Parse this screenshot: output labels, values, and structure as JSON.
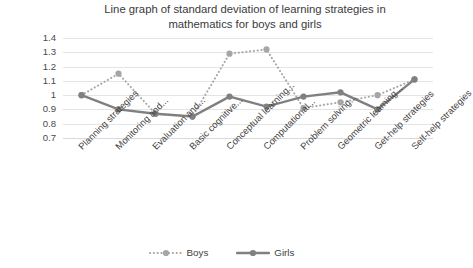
{
  "chart_data": {
    "type": "line",
    "title": "Line graph of standard deviation of learning strategies in mathematics for boys and girls",
    "xlabel": "",
    "ylabel": "",
    "ylim": [
      0.7,
      1.4
    ],
    "ytick_labels": [
      "1.4",
      "1.3",
      "1.2",
      "1.1",
      "1",
      "0.9",
      "0.8",
      "0.7"
    ],
    "ytick_values": [
      1.4,
      1.3,
      1.2,
      1.1,
      1.0,
      0.9,
      0.8,
      0.7
    ],
    "grid": true,
    "legend_position": "bottom",
    "categories": [
      "Planning strategies",
      "Monitoring and...",
      "Evaluation and...",
      "Basic cognitive...",
      "Conceptual learning...",
      "Computational...",
      "Problem solving...",
      "Geometric learning...",
      "Get-help strategies",
      "Self-help strategies"
    ],
    "series": [
      {
        "name": "Boys",
        "color": "#a6a6a6",
        "style": "dotted",
        "values": [
          1.0,
          1.15,
          0.87,
          0.85,
          1.29,
          1.32,
          0.91,
          0.95,
          1.0,
          1.11
        ]
      },
      {
        "name": "Girls",
        "color": "#808080",
        "style": "solid",
        "values": [
          1.0,
          0.9,
          0.87,
          0.85,
          0.99,
          0.92,
          0.99,
          1.02,
          0.9,
          1.11
        ]
      }
    ]
  },
  "legend": {
    "items": [
      {
        "label": "Boys"
      },
      {
        "label": "Girls"
      }
    ]
  }
}
